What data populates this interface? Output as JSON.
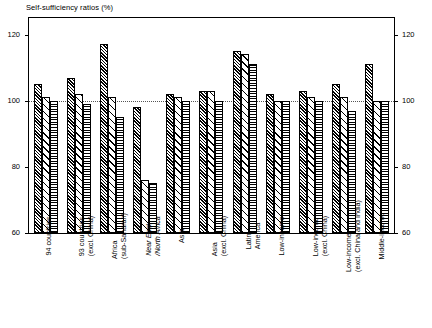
{
  "chart": {
    "title": "Self-sufficiency ratios (%)",
    "legend": [
      {
        "label": "1969/71",
        "pattern": "dense-diagonal-hatch"
      },
      {
        "label": "1983/5",
        "pattern": "sparse-diagonal-hatch"
      },
      {
        "label": "2000",
        "pattern": "horizontal-lines"
      }
    ],
    "y_ticks": [
      "120",
      "100",
      "80",
      "60"
    ],
    "y_ticks_right": [
      "120",
      "100",
      "80",
      "60"
    ]
  },
  "chart_data": {
    "type": "bar",
    "title": "Self-sufficiency ratios (%)",
    "xlabel": "",
    "ylabel": "",
    "ylim": [
      60,
      125
    ],
    "yticks": [
      60,
      80,
      100,
      120
    ],
    "grid": true,
    "gridlines_at": [
      100
    ],
    "legend_position": "top-right",
    "axis_right_mirrored": true,
    "categories": [
      "94 countries",
      "93 countries (excl. China)",
      "Africa (sub-Saharan)",
      "Near East /North Africa",
      "Asia",
      "Asia (excl. China)",
      "Latin America",
      "Low-income",
      "Low-income (excl. China)",
      "Low-income (excl. China and India)",
      "Middle-income"
    ],
    "category_lines": [
      [
        "94 countries"
      ],
      [
        "93 countries",
        "(excl. China)"
      ],
      [
        "Africa",
        "(sub-Saharan)"
      ],
      [
        "Near East",
        "/North Africa"
      ],
      [
        "Asia"
      ],
      [
        "Asia",
        "(excl. China)"
      ],
      [
        "Latin",
        "America"
      ],
      [
        "Low-income"
      ],
      [
        "Low-income",
        "(excl. China)"
      ],
      [
        "Low-income",
        "(excl. China and India)"
      ],
      [
        "Middle-income"
      ]
    ],
    "category_italic": [
      false,
      false,
      false,
      true,
      false,
      false,
      false,
      false,
      false,
      false,
      false
    ],
    "series": [
      {
        "name": "1969/71",
        "values": [
          105,
          107,
          117,
          98,
          102,
          103,
          115,
          102,
          103,
          105,
          111
        ]
      },
      {
        "name": "1983/5",
        "values": [
          101,
          102,
          101,
          76,
          101,
          103,
          114,
          100,
          101,
          101,
          100
        ]
      },
      {
        "name": "2000",
        "values": [
          100,
          99,
          95,
          75,
          100,
          100,
          111,
          100,
          100,
          97,
          100
        ]
      }
    ]
  }
}
